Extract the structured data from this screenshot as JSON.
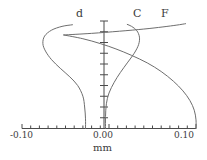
{
  "chart_data": {
    "type": "line",
    "title": "",
    "xlabel": "mm",
    "ylabel": "",
    "xlim": [
      -0.1,
      0.1
    ],
    "ylim": [
      0,
      1
    ],
    "grid": false,
    "legend_position": "curve-end-labels",
    "axis": {
      "x_tick_labels": [
        "-0.10",
        "0.00",
        "0.10"
      ],
      "x_tick_values": [
        -0.1,
        0.0,
        0.1
      ],
      "x_minor_tick_count": 20,
      "y_tick_count": 10,
      "y_axis_at_x": 0.0,
      "axis_color": "#4a4a4a"
    },
    "series": [
      {
        "name": "d",
        "label": "d",
        "color": "#6e6e6e",
        "label_x": 0.0,
        "label_y": 1.0,
        "points": [
          [
            -0.027,
            0.0
          ],
          [
            -0.027,
            0.09
          ],
          [
            -0.028,
            0.2
          ],
          [
            -0.03,
            0.3
          ],
          [
            -0.036,
            0.4
          ],
          [
            -0.045,
            0.48
          ],
          [
            -0.056,
            0.56
          ],
          [
            -0.066,
            0.64
          ],
          [
            -0.073,
            0.72
          ],
          [
            -0.076,
            0.79
          ],
          [
            -0.074,
            0.86
          ],
          [
            -0.066,
            0.915
          ],
          [
            -0.054,
            0.95
          ],
          [
            -0.042,
            0.965
          ]
        ]
      },
      {
        "name": "C",
        "label": "C",
        "color": "#6e6e6e",
        "points": [
          [
            -0.004,
            0.0
          ],
          [
            -0.004,
            0.11
          ],
          [
            -0.003,
            0.23
          ],
          [
            0.0,
            0.33
          ],
          [
            0.006,
            0.43
          ],
          [
            0.013,
            0.52
          ],
          [
            0.021,
            0.61
          ],
          [
            0.029,
            0.7
          ],
          [
            0.034,
            0.78
          ],
          [
            0.035,
            0.85
          ],
          [
            0.032,
            0.91
          ],
          [
            0.026,
            0.95
          ],
          [
            0.021,
            0.968
          ]
        ]
      },
      {
        "name": "F",
        "label": "F",
        "color": "#6e6e6e",
        "points": [
          [
            0.1,
            0.0
          ],
          [
            0.1,
            0.08
          ],
          [
            0.098,
            0.17
          ],
          [
            0.093,
            0.26
          ],
          [
            0.085,
            0.35
          ],
          [
            0.074,
            0.44
          ],
          [
            0.06,
            0.53
          ],
          [
            0.044,
            0.61
          ],
          [
            0.026,
            0.68
          ],
          [
            0.008,
            0.74
          ],
          [
            -0.01,
            0.79
          ],
          [
            -0.03,
            0.835
          ],
          [
            -0.052,
            0.87
          ]
        ]
      },
      {
        "name": "F-upper",
        "label": "F",
        "color": "#6e6e6e",
        "points": [
          [
            -0.052,
            0.87
          ],
          [
            -0.02,
            0.885
          ],
          [
            0.012,
            0.905
          ],
          [
            0.04,
            0.925
          ],
          [
            0.062,
            0.945
          ],
          [
            0.078,
            0.962
          ],
          [
            0.088,
            0.975
          ]
        ]
      }
    ]
  },
  "labels": {
    "d": "d",
    "C": "C",
    "F": "F",
    "x_neg": "-0.10",
    "x_zero": "0.00",
    "x_pos": "0.10",
    "units": "mm"
  }
}
